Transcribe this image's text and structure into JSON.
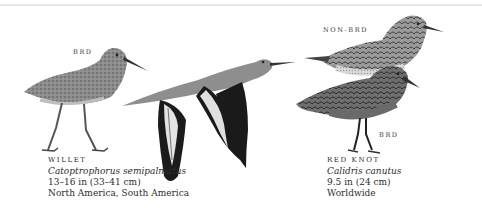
{
  "species": [
    {
      "common_name": "WILLET",
      "scientific_name": "Catoptrophorus semipalmatus",
      "size": "13–16 in (33–41 cm)",
      "range": "North America, South America",
      "labels": {
        "standing": "BRD"
      }
    },
    {
      "common_name": "RED KNOT",
      "scientific_name": "Calidris canutus",
      "size": "9.5 in (24 cm)",
      "range": "Worldwide",
      "labels": {
        "top": "NON-BRD",
        "bottom": "BRD"
      }
    }
  ],
  "colors": {
    "background": "#ffffff",
    "text": "#2e2e2e",
    "bird_gray": "#8a8a8a",
    "wing_black": "#1a1a1a",
    "red_knot_breast": "#7a7a7a"
  }
}
